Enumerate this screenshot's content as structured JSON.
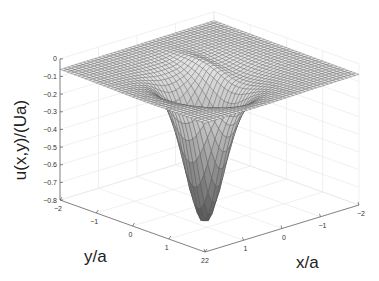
{
  "chart_data": {
    "type": "surface",
    "title": "",
    "xlabel": "x/a",
    "ylabel": "y/a",
    "zlabel": "u(x,y)/(Ua)",
    "xlim": [
      -2,
      2
    ],
    "ylim": [
      -2,
      2
    ],
    "zlim": [
      -0.8,
      0
    ],
    "x_ticks": [
      "2",
      "1",
      "0",
      "-1",
      "-2"
    ],
    "y_ticks": [
      "-2",
      "-1",
      "0",
      "1",
      "2"
    ],
    "z_ticks": [
      "0",
      "-0.1",
      "-0.2",
      "-0.3",
      "-0.4",
      "-0.5",
      "-0.6",
      "-0.7",
      "-0.8"
    ],
    "grid": true,
    "colormap": "gray",
    "surface_summary": {
      "baseline_value": -0.06,
      "min_value": -0.75,
      "min_location": {
        "x": 0.5,
        "y": 0.5
      }
    }
  },
  "axes": {
    "xlabel": "x/a",
    "ylabel": "y/a",
    "zlabel": "u(x,y)/(Ua)"
  }
}
